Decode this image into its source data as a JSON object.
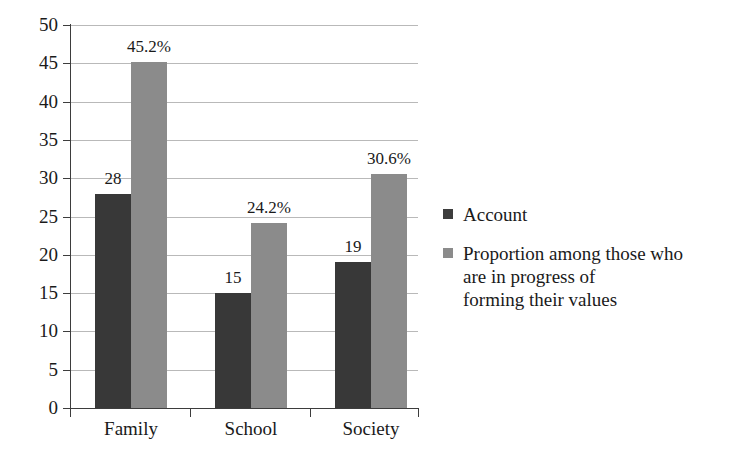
{
  "chart_data": {
    "type": "bar",
    "title": "",
    "subtitle": "",
    "xlabel": "",
    "ylabel": "",
    "categories": [
      "Family",
      "School",
      "Society"
    ],
    "ylim": [
      0,
      50
    ],
    "yticks": [
      0,
      5,
      10,
      15,
      20,
      25,
      30,
      35,
      40,
      45,
      50
    ],
    "ytick_labels": [
      "0",
      "5",
      "10",
      "15",
      "20",
      "25",
      "30",
      "35",
      "40",
      "45",
      "50"
    ],
    "grid": true,
    "legend_position": "right",
    "series": [
      {
        "name": "Account",
        "color": "#383838",
        "values": [
          28,
          15,
          19
        ],
        "data_labels": [
          "28",
          "15",
          "19"
        ]
      },
      {
        "name": "Proportion among those who are in progress of forming their values",
        "color": "#8b8b8b",
        "values": [
          45.2,
          24.2,
          30.6
        ],
        "data_labels": [
          "45.2%",
          "24.2%",
          "30.6%"
        ]
      }
    ]
  },
  "legend": {
    "items": [
      {
        "label": "Account",
        "color": "#383838"
      },
      {
        "label": "Proportion among those who\nare in progress of\nforming their values",
        "color": "#8b8b8b"
      }
    ]
  },
  "colors": {
    "background": "#ffffff",
    "axis": "#3d3d3d",
    "gridline": "#b9b9b9",
    "text": "#1a1a1a",
    "series_dark": "#383838",
    "series_light": "#8b8b8b"
  }
}
